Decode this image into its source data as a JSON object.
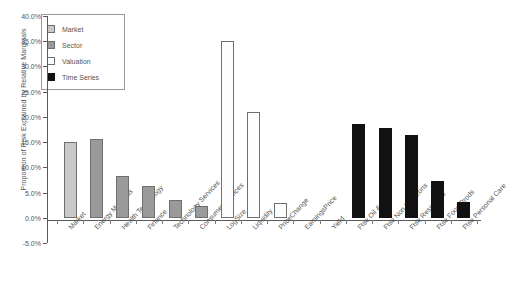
{
  "chart_data": {
    "type": "bar",
    "title": "",
    "xlabel": "",
    "ylabel": "Proportion of Risk Explained by Relative Marginals",
    "ylim": [
      -5.0,
      40.0
    ],
    "ytick_labels": [
      "40.0%",
      "35.0%",
      "30.0%",
      "25.0%",
      "20.0%",
      "15.0%",
      "10.0%",
      "5.0%",
      "0.0%",
      "-5.0%"
    ],
    "ytick_values": [
      40.0,
      35.0,
      30.0,
      25.0,
      20.0,
      15.0,
      10.0,
      5.0,
      0.0,
      -5.0
    ],
    "grid": false,
    "legend_position": "upper-left",
    "categories": [
      "Market",
      "Energy Materials",
      "Health Technology",
      "Finance",
      "Technology Services",
      "Consumer Services",
      "LogSize",
      "Liquidity",
      "PriceChange",
      "EarningsPrice",
      "Yield",
      "Ftse Oil & Gas",
      "Ftse Non Cyc Cons",
      "Ftse Resources",
      "Ftse Food Prods",
      "Ftse Personal Care"
    ],
    "values": [
      15.1,
      15.6,
      8.3,
      6.3,
      3.5,
      2.4,
      35.1,
      21.0,
      3.0,
      0.0,
      0.0,
      18.5,
      17.8,
      16.4,
      7.2,
      3.1
    ],
    "groups": [
      "Market",
      "Sector",
      "Sector",
      "Sector",
      "Sector",
      "Sector",
      "Valuation",
      "Valuation",
      "Valuation",
      "Valuation",
      "Valuation",
      "Time Series",
      "Time Series",
      "Time Series",
      "Time Series",
      "Time Series"
    ],
    "legend": [
      {
        "label": "Market",
        "key": "market",
        "color": "#c9c9c9"
      },
      {
        "label": "Sector",
        "key": "sector",
        "color": "#9a9a9a"
      },
      {
        "label": "Valuation",
        "key": "valuation",
        "color": "#ffffff"
      },
      {
        "label": "Time Series",
        "key": "timeseries",
        "color": "#111111"
      }
    ]
  }
}
